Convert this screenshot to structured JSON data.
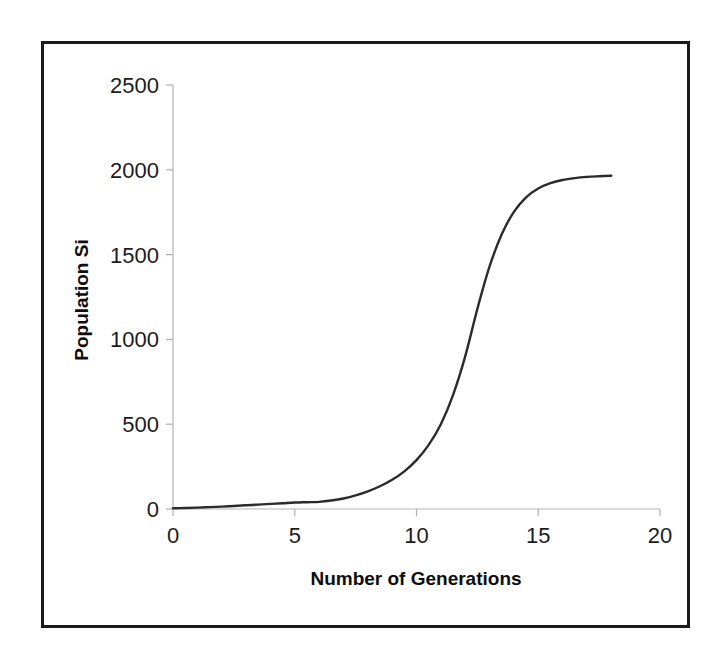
{
  "figure": {
    "background_color": "#ffffff",
    "border_color": "#1a1a1a",
    "plot_line_color": "#2b2b2b",
    "axis_color": "#b4b4b4"
  },
  "chart_data": {
    "type": "line",
    "title": "",
    "subtitle": "",
    "xlabel": "Number of Generations",
    "ylabel": "Population Si",
    "xlim": [
      0,
      20
    ],
    "ylim": [
      0,
      2500
    ],
    "xticks": [
      0,
      5,
      10,
      15,
      20
    ],
    "yticks": [
      0,
      500,
      1000,
      1500,
      2000,
      2500
    ],
    "xtick_labels": [
      "0",
      "5",
      "10",
      "15",
      "20"
    ],
    "ytick_labels": [
      "0",
      "500",
      "1000",
      "1500",
      "2000",
      "2500"
    ],
    "grid": false,
    "legend": false,
    "legend_position": "none",
    "series": [
      {
        "name": "Population Size",
        "color": "#2b2b2b",
        "x": [
          0,
          0.5,
          1,
          1.5,
          2,
          2.5,
          3,
          3.5,
          4,
          4.5,
          5,
          5.5,
          6,
          6.5,
          7,
          7.5,
          8,
          8.5,
          9,
          9.5,
          10,
          10.5,
          11,
          11.5,
          12,
          12.5,
          13,
          13.5,
          14,
          14.5,
          15,
          15.5,
          16,
          16.5,
          17,
          17.5,
          18
        ],
        "y": [
          4,
          6,
          8,
          11,
          14,
          18,
          22,
          26,
          30,
          34,
          38,
          40,
          42,
          50,
          62,
          80,
          104,
          134,
          172,
          222,
          288,
          378,
          500,
          672,
          900,
          1180,
          1430,
          1620,
          1752,
          1838,
          1890,
          1921,
          1940,
          1951,
          1958,
          1962,
          1965
        ]
      }
    ],
    "annotations": []
  },
  "axis_titles": {
    "x": "Number of Generations",
    "y": "Population Si"
  }
}
